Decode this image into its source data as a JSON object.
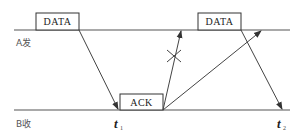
{
  "diagram": {
    "type": "stop-and-wait timing diagram",
    "lanes": {
      "sender": {
        "label": "A发"
      },
      "receiver": {
        "label": "B收"
      }
    },
    "frames": [
      {
        "label": "DATA",
        "lane": "sender",
        "position": "first"
      },
      {
        "label": "ACK",
        "lane": "receiver"
      },
      {
        "label": "DATA",
        "lane": "sender",
        "position": "second"
      }
    ],
    "time_marks": [
      {
        "base": "t",
        "sub": "1"
      },
      {
        "base": "t",
        "sub": "2"
      }
    ],
    "annotations": {
      "lost_marker": "×"
    },
    "colors": {
      "line": "#555555",
      "box_stroke": "#333333",
      "background": "#ffffff"
    }
  }
}
